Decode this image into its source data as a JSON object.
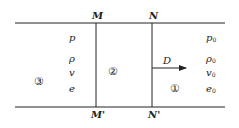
{
  "diagram": {
    "type": "shock-wave-tube-regions",
    "lines": {
      "top_boundary": {
        "x1": 15,
        "x2": 225,
        "y": 23
      },
      "bottom_boundary": {
        "x1": 15,
        "x2": 225,
        "y": 107
      },
      "interface_MM": {
        "x": 96
      },
      "shock_NN": {
        "x": 152
      }
    },
    "labels": {
      "M": "M",
      "N": "N",
      "M_prime": "M'",
      "N_prime": "N'",
      "D": "D"
    },
    "regions": [
      {
        "id": "region-3",
        "marker": "③",
        "variables": [
          "p",
          "ρ",
          "v",
          "e"
        ]
      },
      {
        "id": "region-2",
        "marker": "②",
        "variables": []
      },
      {
        "id": "region-1",
        "marker": "①",
        "variables": [
          "p0",
          "ρ0",
          "v0",
          "e0"
        ]
      }
    ],
    "left_vars": {
      "p": "p",
      "rho": "ρ",
      "v": "v",
      "e": "e"
    },
    "right_vars": {
      "p": "p",
      "rho": "ρ",
      "v": "v",
      "e": "e",
      "sub": "0"
    },
    "markers": {
      "r1": "①",
      "r2": "②",
      "r3": "③"
    },
    "arrow": {
      "label": "D",
      "direction": "right",
      "from_x": 152,
      "to_x": 186,
      "y": 68
    },
    "colors": {
      "line": "#222222",
      "background": "#ffffff"
    }
  }
}
